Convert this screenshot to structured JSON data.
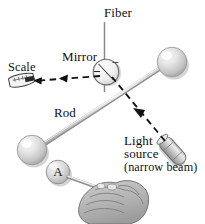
{
  "figure": {
    "type": "physics-apparatus-diagram",
    "background_color": "#ffffff",
    "labels": {
      "fiber": "Fiber",
      "mirror": "Mirror",
      "scale": "Scale",
      "rod": "Rod",
      "light_line1": "Light",
      "light_line2": "source",
      "light_line3": "(narrow beam)",
      "sphere_a": "A"
    },
    "colors": {
      "line_gray": "#8c8c8c",
      "dash_black": "#111111",
      "sphere_light": "#f2f2f2",
      "sphere_mid": "#cfcfcf",
      "sphere_dark": "#9a9a9a",
      "hand_fill": "#b8b8b8",
      "hand_stroke": "#6f6f6f",
      "text": "#101010"
    },
    "elements": {
      "fiber_line": {
        "x": 104,
        "y_top": 22,
        "y_bottom": 92
      },
      "mirror_circle": {
        "cx": 106,
        "cy": 72,
        "r": 13
      },
      "rod_line": {
        "x1": 36,
        "y1": 148,
        "x2": 168,
        "y2": 64
      },
      "sphere_right": {
        "cx": 172,
        "cy": 62,
        "r": 15
      },
      "sphere_left": {
        "cx": 32,
        "cy": 150,
        "r": 15
      },
      "sphere_a": {
        "cx": 58,
        "cy": 172,
        "r": 12
      },
      "light_source": {
        "cx": 172,
        "cy": 150,
        "angle_deg": 48
      },
      "beam_incident": {
        "x1": 166,
        "y1": 142,
        "x2": 110,
        "y2": 74
      },
      "beam_reflected": {
        "x1": 100,
        "y1": 78,
        "x2": 30,
        "y2": 82
      },
      "scale_ruler": {
        "cx": 22,
        "cy": 80
      }
    }
  }
}
